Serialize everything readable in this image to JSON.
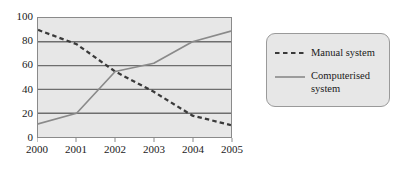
{
  "chart_data": {
    "type": "line",
    "title": "",
    "xlabel": "",
    "ylabel": "",
    "x": [
      "2000",
      "2001",
      "2002",
      "2003",
      "2004",
      "2005"
    ],
    "xlim": [
      2000,
      2005
    ],
    "ylim": [
      0,
      100
    ],
    "yticks": [
      "100",
      "80",
      "60",
      "40",
      "20",
      "0"
    ],
    "ytick_values": [
      100,
      80,
      60,
      40,
      20,
      0
    ],
    "grid": "horizontal",
    "legend_position": "right",
    "series": [
      {
        "name": "Manual system",
        "style": "dashed",
        "color": "#3a3a3a",
        "values": [
          90,
          78,
          55,
          38,
          18,
          10
        ]
      },
      {
        "name": "Computerised system",
        "style": "solid",
        "color": "#8a8a8a",
        "values": [
          11,
          20,
          55,
          62,
          80,
          89
        ]
      }
    ]
  },
  "legend": {
    "items": [
      {
        "label": "Manual system",
        "swatch": "dashed-line-swatch"
      },
      {
        "label": "Computerised system",
        "swatch": "solid-line-swatch"
      }
    ]
  },
  "colors": {
    "plot_background": "#e7e7e7",
    "plot_border": "#8a8a8a",
    "gridline": "#6e6e6e",
    "manual_series": "#3a3a3a",
    "computerised_series": "#8a8a8a",
    "axis_text": "#1a1a1a",
    "legend_background": "#e7e7e7",
    "legend_border": "#9a9a9a"
  }
}
